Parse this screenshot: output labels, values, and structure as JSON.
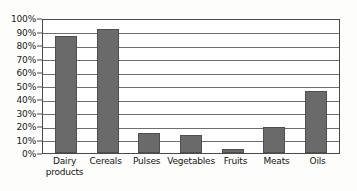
{
  "chart_data": {
    "type": "bar",
    "title": "",
    "xlabel": "",
    "ylabel": "",
    "categories": [
      "Dairy\nproducts",
      "Cereals",
      "Pulses",
      "Vegetables",
      "Fruits",
      "Meats",
      "Oils"
    ],
    "values": [
      87,
      92,
      15,
      13,
      3,
      19,
      46
    ],
    "value_unit": "%",
    "ylim": [
      0,
      100
    ],
    "ytick_labels": [
      "100%",
      "90%",
      "80%",
      "70%",
      "60%",
      "50%",
      "40%",
      "30%",
      "20%",
      "10%",
      "0%"
    ],
    "ytick_values": [
      100,
      90,
      80,
      70,
      60,
      50,
      40,
      30,
      20,
      10,
      0
    ],
    "grid": true,
    "grid_axis": "y",
    "legend": false,
    "legend_position": "none"
  },
  "style": {
    "bar_fill": "#6a6a6a",
    "bar_stroke": "#4f4f4f",
    "grid_color": "#6f6f6f",
    "axis_color": "#4a4a4a",
    "text_color": "#151515",
    "plot_background": "#ffffff",
    "page_background": "#fdfdfc"
  }
}
